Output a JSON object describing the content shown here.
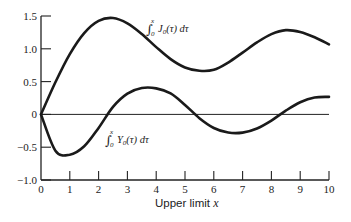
{
  "chart_data": {
    "type": "line",
    "title": "",
    "xlabel": "Upper limit x",
    "ylabel": "",
    "xlim": [
      0,
      10
    ],
    "ylim": [
      -1.0,
      1.5
    ],
    "grid": false,
    "legend_position": "inline annotations",
    "x_ticks": [
      "0",
      "1",
      "2",
      "3",
      "4",
      "5",
      "6",
      "7",
      "8",
      "9",
      "10"
    ],
    "y_ticks": [
      "-1.0",
      "-0.5",
      "0",
      "0.5",
      "1.0",
      "1.5"
    ],
    "zero_line": true,
    "x": [
      0,
      0.5,
      1.0,
      1.5,
      2.0,
      2.5,
      3.0,
      3.5,
      4.0,
      4.5,
      5.0,
      5.5,
      6.0,
      6.5,
      7.0,
      7.5,
      8.0,
      8.5,
      9.0,
      9.5,
      10.0
    ],
    "series": [
      {
        "name": "∫₀ˣ J₀(τ) dτ",
        "values": [
          0,
          0.4896,
          0.9197,
          1.2402,
          1.4263,
          1.469,
          1.3875,
          1.2248,
          1.0258,
          0.843,
          0.7153,
          0.6653,
          0.6793,
          0.7905,
          0.9422,
          1.0975,
          1.2235,
          1.2842,
          1.2556,
          1.1753,
          1.067
        ]
      },
      {
        "name": "∫₀ˣ Y₀(τ) dτ",
        "values": [
          0,
          -0.553,
          -0.6146,
          -0.4863,
          -0.2065,
          0.1147,
          0.3167,
          0.4018,
          0.397,
          0.319,
          0.1447,
          -0.0577,
          -0.2069,
          -0.2766,
          -0.2777,
          -0.2142,
          -0.0937,
          0.0576,
          0.1851,
          0.2579,
          0.2675
        ]
      }
    ],
    "annotations": [
      {
        "series": 0,
        "integral_upper": "x",
        "integral_lower": "0",
        "text": "J",
        "subscript": "0",
        "rest": "(τ) dτ"
      },
      {
        "series": 1,
        "integral_upper": "x",
        "integral_lower": "0",
        "text": "Y",
        "subscript": "0",
        "rest": "(τ) dτ"
      }
    ],
    "axis_title_text": "Upper limit ",
    "axis_title_var": "x"
  },
  "colors": {
    "line": "#1a1a1a",
    "axis": "#222222",
    "background": "#ffffff"
  }
}
